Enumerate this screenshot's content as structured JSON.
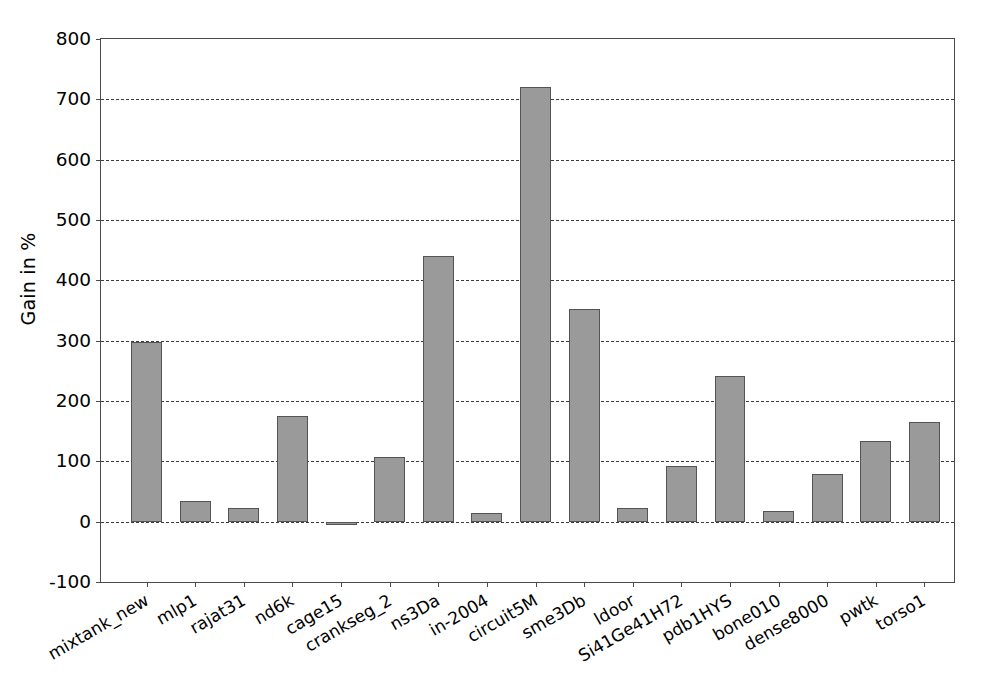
{
  "chart_data": {
    "type": "bar",
    "title": "",
    "xlabel": "",
    "ylabel": "Gain in %",
    "ylim": [
      -100,
      800
    ],
    "yticks": [
      -100,
      0,
      100,
      200,
      300,
      400,
      500,
      600,
      700,
      800
    ],
    "ytick_labels": [
      "-100",
      "0",
      "100",
      "200",
      "300",
      "400",
      "500",
      "600",
      "700",
      "800"
    ],
    "grid": true,
    "grid_axis": "y",
    "grid_style": "dashed",
    "legend": false,
    "bar_color": "#9a9a9a",
    "bar_edge_color": "#545454",
    "xtick_rotation": -30,
    "categories": [
      "mixtank_new",
      "mlp1",
      "rajat31",
      "nd6k",
      "cage15",
      "crankseg_2",
      "ns3Da",
      "in-2004",
      "circuit5M",
      "sme3Db",
      "ldoor",
      "Si41Ge41H72",
      "pdb1HYS",
      "bone010",
      "dense8000",
      "pwtk",
      "torso1"
    ],
    "values": [
      298,
      35,
      22,
      175,
      -5,
      107,
      440,
      15,
      720,
      352,
      22,
      92,
      242,
      17,
      79,
      133,
      165
    ]
  }
}
